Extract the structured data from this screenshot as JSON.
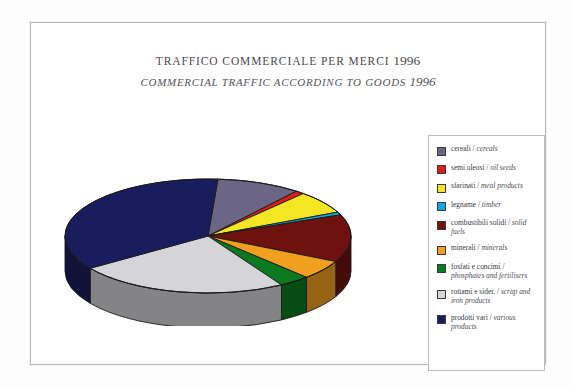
{
  "title": {
    "italian": "TRAFFICO COMMERCIALE PER MERCI",
    "italian_year": "1996",
    "english": "COMMERCIAL TRAFFIC ACCORDING TO GOODS",
    "english_year": "1996"
  },
  "legend": {
    "items": [
      {
        "label_it": "cereali",
        "sep": " / ",
        "label_en": "cereals",
        "color": "#6b6685"
      },
      {
        "label_it": "semi oleosi",
        "sep": " / ",
        "label_en": "oil seeds",
        "color": "#e01b18"
      },
      {
        "label_it": "sfarinati",
        "sep": " / ",
        "label_en": "meal products",
        "color": "#f5e624"
      },
      {
        "label_it": "legname",
        "sep": " / ",
        "label_en": "timber",
        "color": "#12a6dd"
      },
      {
        "label_it": "combustibili solidi",
        "sep": " / ",
        "label_en": "solid fuels",
        "color": "#6e1210"
      },
      {
        "label_it": "minerali",
        "sep": " / ",
        "label_en": "minerals",
        "color": "#f0a01e"
      },
      {
        "label_it": "fosfati e concimi",
        "sep": " / ",
        "label_en": "phosphates and fertilisers",
        "color": "#0b7a1e"
      },
      {
        "label_it": "rottami e sider.",
        "sep": " / ",
        "label_en": "scrap and iron products",
        "color": "#d5d5d9"
      },
      {
        "label_it": "prodotti vari",
        "sep": " / ",
        "label_en": "various products",
        "color": "#191d5e"
      }
    ]
  },
  "chart_data": {
    "type": "pie",
    "xlabel": "",
    "ylabel": "",
    "legend_position": "right",
    "grid": false,
    "three_d": true,
    "categories": [
      "cereali / cereals",
      "semi oleosi / oil seeds",
      "sfarinati / meal products",
      "legname / timber",
      "combustibili solidi / solid fuels",
      "minerali / minerals",
      "fosfati e concimi / phosphates and fertilisers",
      "rottami e sider. / scrap and iron products",
      "prodotti vari / various products"
    ],
    "values": [
      9.5,
      1.0,
      6.5,
      0.8,
      13.5,
      5.5,
      3.5,
      24.0,
      35.7
    ],
    "colors": [
      "#6b6685",
      "#e01b18",
      "#f5e624",
      "#12a6dd",
      "#6e1210",
      "#f0a01e",
      "#0b7a1e",
      "#d5d5d9",
      "#191d5e"
    ],
    "units": "percent of total commercial traffic"
  }
}
